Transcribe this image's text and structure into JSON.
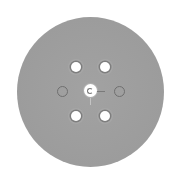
{
  "image": {
    "subject": "gray circular disc with hole pattern",
    "description": "Top-down view of a gray circular pad/disc with six perimeter holes and a center hole",
    "colors": {
      "background": "#ffffff",
      "disk": "#9e9e9e",
      "hole_fill": "#ffffff",
      "ring_outline": "#6f6f6f"
    },
    "holes": {
      "filled_count": 4,
      "open_ring_count": 2,
      "center_count": 1
    }
  }
}
